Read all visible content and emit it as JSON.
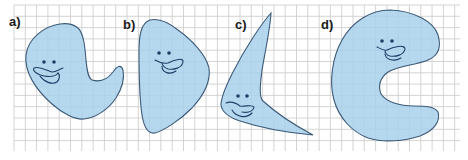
{
  "figure": {
    "grid": {
      "x0": 14,
      "y0": 5,
      "x1": 460,
      "y1": 151,
      "step": 11.3,
      "color": "#cfcfcf"
    },
    "fill_color": "#a9d1ec",
    "outline_color": "#3c5a78",
    "face_color": "#1f3f66",
    "panels": [
      {
        "id": "a",
        "label": "a)"
      },
      {
        "id": "b",
        "label": "b)"
      },
      {
        "id": "c",
        "label": "c)"
      },
      {
        "id": "d",
        "label": "d)"
      }
    ]
  }
}
